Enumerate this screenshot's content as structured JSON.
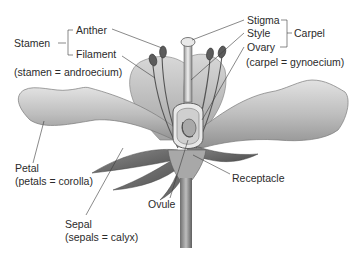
{
  "diagram": {
    "labels": {
      "stamen": "Stamen",
      "anther": "Anther",
      "filament": "Filament",
      "stamen_note": "(stamen = androecium)",
      "stigma": "Stigma",
      "style": "Style",
      "ovary": "Ovary",
      "carpel": "Carpel",
      "carpel_note": "(carpel = gynoecium)",
      "petal": "Petal",
      "petal_note": "(petals = corolla)",
      "sepal": "Sepal",
      "sepal_note": "(sepals = calyx)",
      "ovule": "Ovule",
      "receptacle": "Receptacle"
    },
    "groups": [
      {
        "name": "Stamen",
        "parts": [
          "Anther",
          "Filament"
        ],
        "note": "(stamen = androecium)"
      },
      {
        "name": "Carpel",
        "parts": [
          "Stigma",
          "Style",
          "Ovary"
        ],
        "note": "(carpel = gynoecium)"
      }
    ],
    "colors": {
      "text": "#2b2b2b",
      "leader_line": "#3a3a3a",
      "petal_light": "#d6d6d6",
      "petal_dark": "#8a8a8a",
      "background": "#ffffff"
    }
  }
}
